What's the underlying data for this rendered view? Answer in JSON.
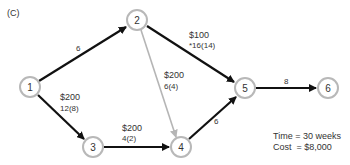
{
  "panel_label": "(C)",
  "nodes": [
    {
      "id": "1",
      "label": "1",
      "cx": 30,
      "cy": 87
    },
    {
      "id": "2",
      "label": "2",
      "cx": 137,
      "cy": 20
    },
    {
      "id": "3",
      "label": "3",
      "cx": 93,
      "cy": 147
    },
    {
      "id": "4",
      "label": "4",
      "cx": 181,
      "cy": 147
    },
    {
      "id": "5",
      "label": "5",
      "cx": 245,
      "cy": 88
    },
    {
      "id": "6",
      "label": "6",
      "cx": 328,
      "cy": 88
    }
  ],
  "edges": [
    {
      "from": "1",
      "to": "2",
      "style": "black",
      "cost": "",
      "time": "6"
    },
    {
      "from": "2",
      "to": "5",
      "style": "black",
      "cost": "$100",
      "time": "*16(14)"
    },
    {
      "from": "2",
      "to": "4",
      "style": "gray",
      "cost": "$200",
      "time": "6(4)"
    },
    {
      "from": "1",
      "to": "3",
      "style": "black",
      "cost": "$200",
      "time": "12(8)"
    },
    {
      "from": "3",
      "to": "4",
      "style": "black",
      "cost": "$200",
      "time": "4(2)"
    },
    {
      "from": "4",
      "to": "5",
      "style": "black",
      "cost": "",
      "time": "6"
    },
    {
      "from": "5",
      "to": "6",
      "style": "black",
      "cost": "",
      "time": "8"
    }
  ],
  "summary": {
    "time_line": "Time = 30 weeks",
    "cost_line": "Cost  = $8,000"
  }
}
